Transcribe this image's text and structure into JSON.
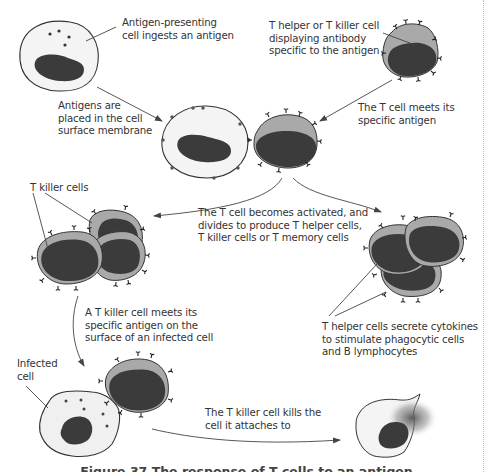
{
  "figure": {
    "caption": "Figure 37 The response of T cells to an antigen",
    "colors": {
      "background": "#ffffff",
      "apc_cytoplasm": "#f3f3f3",
      "t_cell_cytoplasm": "#a9a9a9",
      "nucleus": "#3b3b3b",
      "outline": "#333333",
      "text": "#333333",
      "arrow": "#444444",
      "page_border": "#bdbdbd"
    }
  },
  "labels": {
    "apc_ingests": "Antigen-presenting\ncell ingests an antigen",
    "antigens_placed": "Antigens are\nplaced in the cell\nsurface membrane",
    "t_cell_displaying": "T helper or T killer cell\ndisplaying antibody\nspecific to the antigen",
    "t_cell_meets": "The T cell meets its\nspecific antigen",
    "activated_divides": "The T cell becomes activated, and\ndivides to produce T helper cells,\nT killer cells or T memory cells",
    "t_killer_cells": "T killer cells",
    "killer_meets_infected": "A T killer cell meets its\nspecific antigen on the\nsurface of an infected cell",
    "helper_secretes": "T helper cells secrete cytokines\nto stimulate phagocytic cells\nand B lymphocytes",
    "infected_cell": "Infected\ncell",
    "killer_kills": "The T killer cell kills the\ncell it attaches to"
  },
  "stages": [
    {
      "id": "apc-ingesting",
      "name": "Antigen-presenting cell"
    },
    {
      "id": "t-cell-initial",
      "name": "T helper or T killer cell"
    },
    {
      "id": "apc-presenting",
      "name": "Antigen-presenting cell with surface antigens"
    },
    {
      "id": "t-cell-binding",
      "name": "T cell bound to APC"
    },
    {
      "id": "t-killer-clones",
      "name": "T killer cells"
    },
    {
      "id": "t-helper-clones",
      "name": "T helper cells"
    },
    {
      "id": "infected-cell",
      "name": "Infected cell"
    },
    {
      "id": "t-killer-attached",
      "name": "T killer cell attached"
    },
    {
      "id": "dying-cell",
      "name": "Killed cell"
    }
  ]
}
